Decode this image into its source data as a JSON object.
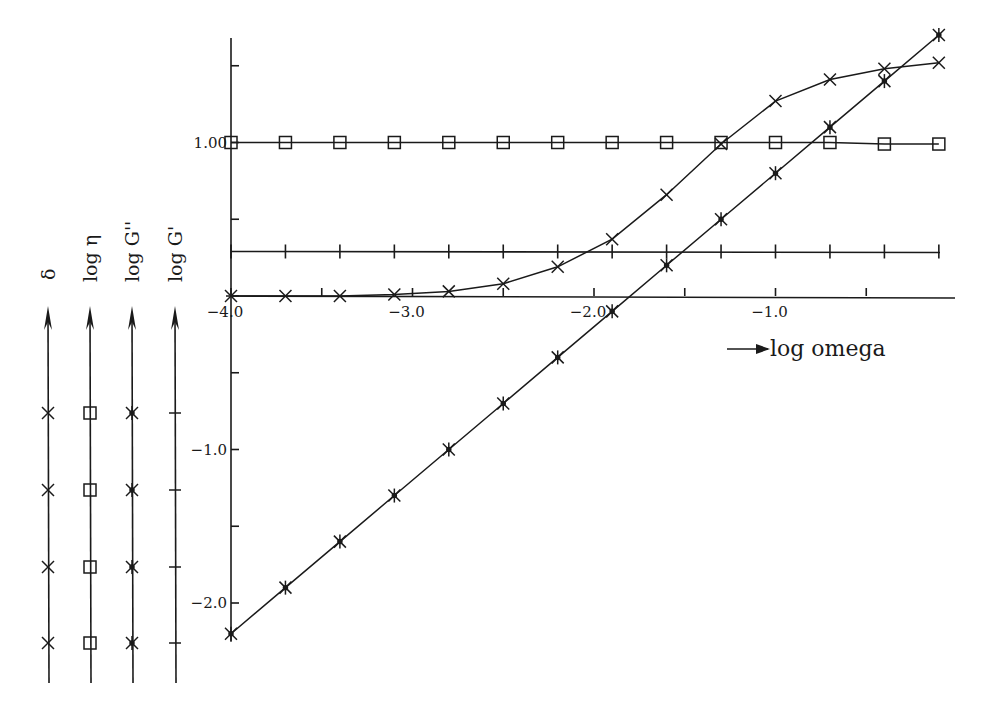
{
  "chart_data": {
    "type": "line",
    "title": "",
    "xlabel": "log omega",
    "ylabel": "",
    "x_axis_arrow_label": "log omega",
    "xlim": [
      -4.0,
      -0.1
    ],
    "ylim": [
      -2.2,
      1.7
    ],
    "x_tick_labels": [
      "-4.0",
      "-3.0",
      "-2.0",
      "-1.0"
    ],
    "x_ticks": [
      -4.0,
      -3.5,
      -3.0,
      -2.5,
      -2.0,
      -1.5,
      -1.0,
      -0.5
    ],
    "y_tick_labels": [
      "1.00",
      "-1.0",
      "-2.0"
    ],
    "y_ticks": [
      1.5,
      1.0,
      0.5,
      0.0,
      -0.5,
      -1.0,
      -1.5,
      -2.0
    ],
    "grid": false,
    "legend_position": "left, vertical rotated axis labels",
    "legend": [
      {
        "label": "δ",
        "marker": "x"
      },
      {
        "label": "log η",
        "marker": "square"
      },
      {
        "label": "log G''",
        "marker": "asterisk"
      },
      {
        "label": "log G'",
        "marker": "plus-tick"
      }
    ],
    "x": [
      -4.0,
      -3.7,
      -3.4,
      -3.1,
      -2.8,
      -2.5,
      -2.2,
      -1.9,
      -1.6,
      -1.3,
      -1.0,
      -0.7,
      -0.4,
      -0.1
    ],
    "series": [
      {
        "name": "x-marker curve",
        "marker": "x",
        "values": [
          0.0,
          0.0,
          0.0,
          0.01,
          0.03,
          0.08,
          0.19,
          0.37,
          0.66,
          0.99,
          1.27,
          1.41,
          1.48,
          1.52
        ]
      },
      {
        "name": "square-marker curve",
        "marker": "square",
        "values": [
          1.0,
          1.0,
          1.0,
          1.0,
          1.0,
          1.0,
          1.0,
          1.0,
          1.0,
          1.0,
          1.0,
          1.0,
          0.99,
          0.99
        ]
      },
      {
        "name": "asterisk-marker curve",
        "marker": "asterisk",
        "values": [
          -2.2,
          -1.9,
          -1.6,
          -1.3,
          -1.0,
          -0.7,
          -0.4,
          -0.1,
          0.2,
          0.5,
          0.8,
          1.1,
          1.4,
          1.7
        ]
      }
    ],
    "reference_line": {
      "y": 0.29,
      "ticks_every": 0.3
    }
  }
}
